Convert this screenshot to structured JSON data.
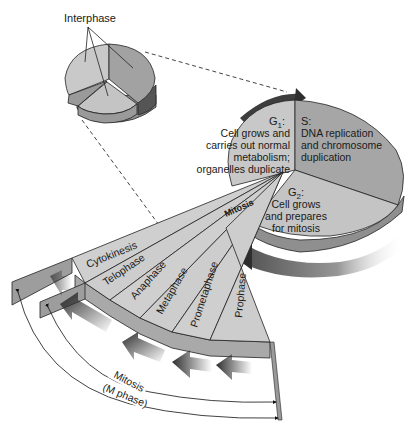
{
  "diagram": {
    "title_label": "Interphase",
    "small_pie": {
      "label": "Interphase",
      "pointer_count": 3
    },
    "large_pie": {
      "sectors": [
        {
          "id": "g1",
          "phase": "G",
          "subscript": "1",
          "suffix": ":",
          "lines": [
            "Cell grows and",
            "carries out normal",
            "metabolism;",
            "organelles duplicate"
          ]
        },
        {
          "id": "s",
          "phase": "S:",
          "lines": [
            "DNA replication",
            "and chromosome",
            "duplication"
          ]
        },
        {
          "id": "g2",
          "phase": "G",
          "subscript": "2",
          "suffix": ":",
          "lines": [
            "Cell grows",
            "and prepares",
            "for mitosis"
          ]
        }
      ],
      "wedge_label": "Mitosis"
    },
    "mitosis_fan": {
      "stages": [
        "Cytokinesis",
        "Telophase",
        "Anaphase",
        "Metaphase",
        "Prometaphase",
        "Prophase"
      ]
    },
    "brackets": {
      "inner_label": "Mitosis",
      "outer_label": "(M phase)"
    },
    "colors": {
      "g1_fill": "#c8c8c8",
      "s_fill": "#a6a6a6",
      "g2_fill": "#c4c4c4",
      "side_fill": "#8f8f8f",
      "fan_fill": "#cfcfcf",
      "fan_side": "#a9a9a9",
      "arrow_dark": "#3a3a3a",
      "line": "#222222"
    }
  }
}
